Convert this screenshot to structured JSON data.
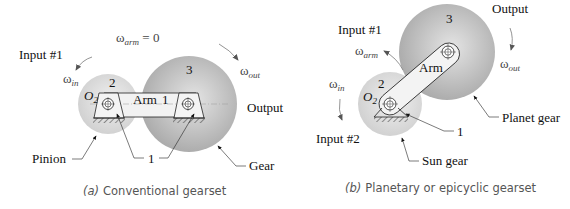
{
  "figure_a": {
    "caption_prefix": "(a)",
    "caption": "Conventional gearset",
    "omega_arm_label": "ω",
    "omega_arm_sub": "arm",
    "omega_arm_value": " = 0",
    "input_label": "Input #1",
    "omega_in": "ω",
    "omega_in_sub": "in",
    "omega_out": "ω",
    "omega_out_sub": "out",
    "output_label": "Output",
    "gear2_number": "2",
    "gear3_number": "3",
    "o2_label": "O",
    "o2_sub": "2",
    "arm_label": "Arm",
    "arm_link": "1",
    "ground_label": "1",
    "pinion_label": "Pinion",
    "gear_label": "Gear"
  },
  "figure_b": {
    "caption_prefix": "(b)",
    "caption": "Planetary or epicyclic gearset",
    "input1_label": "Input #1",
    "input2_label": "Input #2",
    "omega_arm": "ω",
    "omega_arm_sub": "arm",
    "omega_in": "ω",
    "omega_in_sub": "in",
    "omega_out": "ω",
    "omega_out_sub": "out",
    "output_label": "Output",
    "gear2_number": "2",
    "gear3_number": "3",
    "o2_label": "O",
    "o2_sub": "2",
    "arm_label": "Arm",
    "ground_label": "1",
    "planet_label": "Planet gear",
    "sun_label": "Sun gear"
  },
  "colors": {
    "pinion_fill": "#e6e6e6",
    "gear_fill": "#b5b5b5",
    "gear_center": "#e2e2e2",
    "arm_fill": "#f4f4f4",
    "line": "#222222"
  }
}
